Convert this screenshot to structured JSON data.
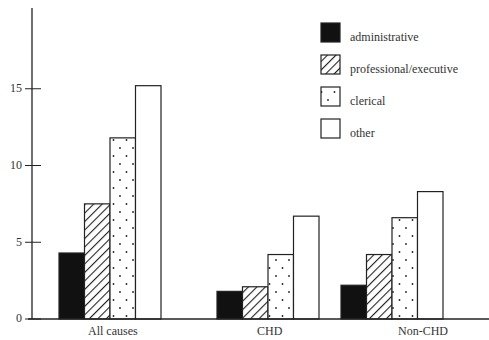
{
  "chart_data": {
    "type": "bar",
    "title": "",
    "xlabel": "",
    "ylabel": "",
    "ylim": [
      0,
      20
    ],
    "yticks": [
      0,
      5,
      10,
      15
    ],
    "grid": false,
    "legend_position": "upper right",
    "categories": [
      "All causes",
      "CHD",
      "Non-CHD"
    ],
    "series": [
      {
        "name": "administrative",
        "pattern": "solid-black",
        "values": [
          4.3,
          1.8,
          2.2
        ]
      },
      {
        "name": "professional/executive",
        "pattern": "diagonal-hatch",
        "values": [
          7.5,
          2.1,
          4.2
        ]
      },
      {
        "name": "clerical",
        "pattern": "dots",
        "values": [
          11.8,
          4.2,
          6.6
        ]
      },
      {
        "name": "other",
        "pattern": "white",
        "values": [
          15.2,
          6.7,
          8.3
        ]
      }
    ]
  },
  "axis": {
    "ticks": [
      "0",
      "5",
      "10",
      "15"
    ]
  },
  "legend": {
    "items": [
      "administrative",
      "professional/executive",
      "clerical",
      "other"
    ]
  },
  "categories": [
    "All causes",
    "CHD",
    "Non-CHD"
  ]
}
